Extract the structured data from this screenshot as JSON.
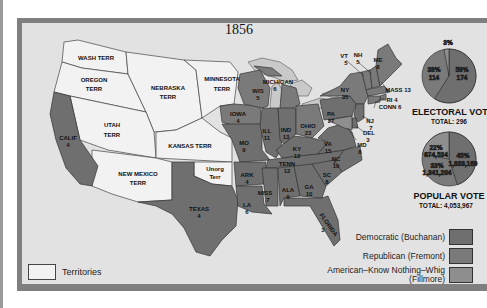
{
  "map": {
    "title": "1856",
    "colors": {
      "democratic": "#6f6f6f",
      "republican": "#7a7a7a",
      "american": "#8e8e8e",
      "territories": "#f2f2f2",
      "water": "#c8c8c8",
      "background": "#e2e2e2",
      "frame": "#7f7f7f"
    },
    "territories": [
      {
        "name": "WASH TERR"
      },
      {
        "name": "OREGON TERR"
      },
      {
        "name": "NEBRASKA TERR"
      },
      {
        "name": "MINNESOTA TERR"
      },
      {
        "name": "UTAH TERR"
      },
      {
        "name": "KANSAS TERR"
      },
      {
        "name": "NEW MEXICO TERR"
      },
      {
        "name": "Unorg Terr"
      }
    ],
    "states": [
      {
        "abbr": "CALIF",
        "votes": "4",
        "party": "democratic"
      },
      {
        "abbr": "TEXAS",
        "votes": "4",
        "party": "democratic"
      },
      {
        "abbr": "IOWA",
        "votes": "4",
        "party": "republican"
      },
      {
        "abbr": "MO",
        "votes": "9",
        "party": "democratic"
      },
      {
        "abbr": "ARK",
        "votes": "4",
        "party": "democratic"
      },
      {
        "abbr": "LA",
        "votes": "6",
        "party": "democratic"
      },
      {
        "abbr": "WIS",
        "votes": "5",
        "party": "republican"
      },
      {
        "abbr": "MICHIGAN",
        "votes": "6",
        "party": "republican"
      },
      {
        "abbr": "ILL",
        "votes": "11",
        "party": "democratic"
      },
      {
        "abbr": "IND",
        "votes": "13",
        "party": "democratic"
      },
      {
        "abbr": "OHIO",
        "votes": "23",
        "party": "republican"
      },
      {
        "abbr": "KY",
        "votes": "12",
        "party": "democratic"
      },
      {
        "abbr": "TENN",
        "votes": "12",
        "party": "democratic"
      },
      {
        "abbr": "MISS",
        "votes": "7",
        "party": "democratic"
      },
      {
        "abbr": "ALA",
        "votes": "9",
        "party": "democratic"
      },
      {
        "abbr": "GA",
        "votes": "10",
        "party": "democratic"
      },
      {
        "abbr": "FLORIDA",
        "votes": "3",
        "party": "democratic"
      },
      {
        "abbr": "SC",
        "votes": "8",
        "party": "democratic"
      },
      {
        "abbr": "NC",
        "votes": "10",
        "party": "democratic"
      },
      {
        "abbr": "VA",
        "votes": "15",
        "party": "democratic"
      },
      {
        "abbr": "PA",
        "votes": "27",
        "party": "democratic"
      },
      {
        "abbr": "NY",
        "votes": "35",
        "party": "republican"
      },
      {
        "abbr": "VT",
        "votes": "5",
        "party": "republican"
      },
      {
        "abbr": "NH",
        "votes": "5",
        "party": "republican"
      },
      {
        "abbr": "ME",
        "votes": "8",
        "party": "republican"
      },
      {
        "abbr": "MASS",
        "votes": "13",
        "party": "republican"
      },
      {
        "abbr": "RI",
        "votes": "4",
        "party": "republican"
      },
      {
        "abbr": "CONN",
        "votes": "6",
        "party": "republican"
      },
      {
        "abbr": "NJ",
        "votes": "7",
        "party": "democratic"
      },
      {
        "abbr": "DEL",
        "votes": "3",
        "party": "democratic"
      },
      {
        "abbr": "MD",
        "votes": "8",
        "party": "american"
      }
    ],
    "labels": {
      "wash": "WASH TERR",
      "oregon1": "OREGON",
      "oregon2": "TERR",
      "nebraska1": "NEBRASKA",
      "nebraska2": "TERR",
      "minnesota1": "MINNESOTA",
      "minnesota2": "TERR",
      "utah1": "UTAH",
      "utah2": "TERR",
      "kansas": "KANSAS TERR",
      "newmexico1": "NEW MEXICO",
      "newmexico2": "TERR",
      "unorg1": "Unorg",
      "unorg2": "Terr",
      "calif1": "CALIF",
      "calif2": "4",
      "texas1": "TEXAS",
      "texas2": "4",
      "iowa1": "IOWA",
      "iowa2": "4",
      "mo1": "MO",
      "mo2": "9",
      "ark1": "ARK",
      "ark2": "4",
      "la1": "LA",
      "la2": "6",
      "wis1": "WIS",
      "wis2": "5",
      "mich1": "MICHIGAN",
      "mich2": "6",
      "ill1": "ILL",
      "ill2": "11",
      "ind1": "IND",
      "ind2": "13",
      "ohio1": "OHIO",
      "ohio2": "23",
      "ky1": "KY",
      "ky2": "12",
      "tenn1": "TENN",
      "tenn2": "12",
      "miss1": "MISS",
      "miss2": "7",
      "ala1": "ALA",
      "ala2": "9",
      "ga1": "GA",
      "ga2": "10",
      "fla1": "FLORIDA",
      "fla2": "3",
      "sc1": "SC",
      "sc2": "8",
      "nc1": "NC",
      "nc2": "10",
      "va1": "VA",
      "va2": "15",
      "pa1": "PA",
      "pa2": "27",
      "ny1": "NY",
      "ny2": "35",
      "vt1": "VT",
      "vt2": "5",
      "nh1": "NH",
      "nh2": "5",
      "me1": "ME",
      "me2": "8",
      "mass": "MASS 13",
      "ri": "RI 4",
      "conn": "CONN 6",
      "nj1": "NJ",
      "nj2": "7",
      "del1": "DEL",
      "del2": "3",
      "md1": "MD",
      "md2": "8"
    }
  },
  "electoral_vote": {
    "title": "ELECTORAL VOTE",
    "total_label": "TOTAL: 296",
    "slices": [
      {
        "party": "American",
        "percent": "3%",
        "votes": "8"
      },
      {
        "party": "Republican",
        "percent": "38%",
        "votes": "114"
      },
      {
        "party": "Democratic",
        "percent": "59%",
        "votes": "174"
      }
    ]
  },
  "popular_vote": {
    "title": "POPULAR VOTE",
    "total_label": "TOTAL: 4,053,967",
    "slices": [
      {
        "party": "American",
        "percent": "22%",
        "votes": "874,534"
      },
      {
        "party": "Republican",
        "percent": "33%",
        "votes": "1,341,264"
      },
      {
        "party": "Democratic",
        "percent": "45%",
        "votes": "1,838,169"
      }
    ]
  },
  "legend": {
    "democratic": "Democratic (Buchanan)",
    "republican": "Republican (Fremont)",
    "american_line1": "American–Know Nothing–Whig",
    "american_line2": "(Fillmore)",
    "territories": "Territories"
  }
}
